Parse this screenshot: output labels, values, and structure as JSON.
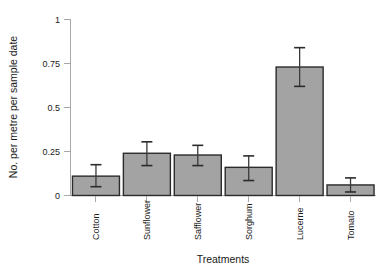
{
  "chart_data": {
    "type": "bar",
    "title": "",
    "xlabel": "Treatments",
    "ylabel": "No. per metre per sample date",
    "categories": [
      "Cotton",
      "Sunflower",
      "Safflower",
      "Sorghum",
      "Lucerne",
      "Tomato"
    ],
    "values": [
      0.11,
      0.24,
      0.23,
      0.16,
      0.73,
      0.06
    ],
    "errors_upper": [
      0.175,
      0.305,
      0.285,
      0.225,
      0.84,
      0.1
    ],
    "errors_lower": [
      0.05,
      0.17,
      0.17,
      0.085,
      0.62,
      0.02
    ],
    "ylim": [
      0,
      1
    ],
    "ytick_labels": [
      "0",
      "0.25",
      "0.5",
      "0.75",
      "1"
    ],
    "ytick_values": [
      0,
      0.25,
      0.5,
      0.75,
      1
    ],
    "grid": false,
    "legend": null,
    "series": [
      {
        "name": "No. per metre per sample date",
        "values": [
          0.11,
          0.24,
          0.23,
          0.16,
          0.73,
          0.06
        ]
      }
    ]
  },
  "colors": {
    "bar_fill": "#a3a3a3",
    "bar_border": "#2b2b2b",
    "axis": "#a8a8a8",
    "text": "#1a1a1a",
    "background": "#ffffff"
  }
}
